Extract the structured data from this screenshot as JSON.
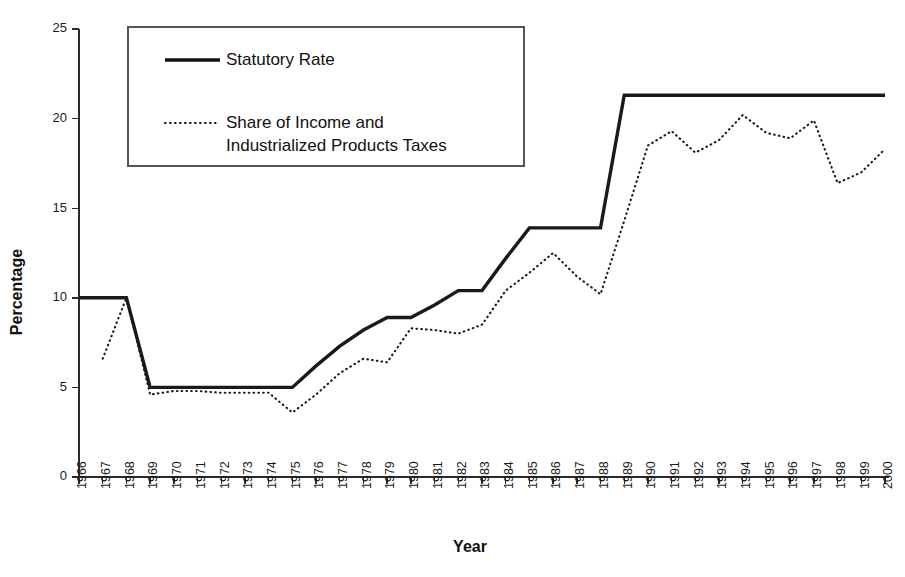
{
  "chart_data": {
    "type": "line",
    "title": "",
    "xlabel": "Year",
    "ylabel": "Percentage",
    "ylim": [
      0,
      25
    ],
    "yticks": [
      0,
      5,
      10,
      15,
      20,
      25
    ],
    "grid": false,
    "legend_position": "upper-left-inside",
    "x": [
      1966,
      1967,
      1968,
      1969,
      1970,
      1971,
      1972,
      1973,
      1974,
      1975,
      1976,
      1977,
      1978,
      1979,
      1980,
      1981,
      1982,
      1983,
      1984,
      1985,
      1986,
      1987,
      1988,
      1989,
      1990,
      1991,
      1992,
      1993,
      1994,
      1995,
      1996,
      1997,
      1998,
      1999,
      2000
    ],
    "xtick_labels": [
      "1966",
      "1967",
      "1968",
      "1969",
      "1970",
      "1971",
      "1972",
      "1973",
      "1974",
      "1975",
      "1976",
      "1977",
      "1978",
      "1979",
      "1980",
      "1981",
      "1982",
      "1983",
      "1984",
      "1985",
      "1986",
      "1987",
      "1988",
      "1989",
      "1990",
      "1991",
      "1992",
      "1993",
      "1994",
      "1995",
      "1996",
      "1997",
      "1998",
      "1999",
      "2000"
    ],
    "series": [
      {
        "name": "Statutory Rate",
        "style": "solid",
        "values": [
          10.0,
          10.0,
          10.0,
          5.0,
          5.0,
          5.0,
          5.0,
          5.0,
          5.0,
          5.0,
          6.2,
          7.3,
          8.2,
          8.9,
          8.9,
          9.6,
          10.4,
          10.4,
          12.2,
          13.9,
          13.9,
          13.9,
          13.9,
          21.3,
          21.3,
          21.3,
          21.3,
          21.3,
          21.3,
          21.3,
          21.3,
          21.3,
          21.3,
          21.3,
          21.3
        ]
      },
      {
        "name": "Share of Income and Industrialized Products Taxes",
        "style": "dotted",
        "values": [
          null,
          6.6,
          10.0,
          4.6,
          4.8,
          4.8,
          4.7,
          4.7,
          4.7,
          3.6,
          4.6,
          5.8,
          6.6,
          6.4,
          8.3,
          8.2,
          8.0,
          8.5,
          10.4,
          11.4,
          12.5,
          11.2,
          10.2,
          14.3,
          18.5,
          19.3,
          18.1,
          18.8,
          20.2,
          19.2,
          18.9,
          19.9,
          16.4,
          17.0,
          18.3
        ]
      }
    ]
  },
  "legend": {
    "entries": [
      {
        "label": "Statutory Rate",
        "style": "solid"
      },
      {
        "label_line1": "Share of Income and",
        "label_line2": "Industrialized Products Taxes",
        "style": "dotted"
      }
    ]
  },
  "axes": {
    "y_title": "Percentage",
    "x_title": "Year"
  }
}
